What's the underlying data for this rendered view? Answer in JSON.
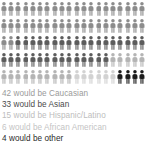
{
  "infographic": {
    "type": "pictogram",
    "total_figures": 100,
    "rows": 5,
    "columns": 20,
    "icon_name": "person-icon"
  },
  "chart_data": {
    "type": "bar",
    "title": "",
    "subtitle": "",
    "xlabel": "",
    "ylabel": "",
    "categories": [
      "Caucasian",
      "Asian",
      "Hispanic/Latino",
      "African American",
      "Other"
    ],
    "values": [
      42,
      33,
      15,
      6,
      4
    ],
    "unit": "people per 100",
    "total": 100,
    "grid": false,
    "legend_position": "below",
    "colors": [
      "#8c8c8c",
      "#5c5c5c",
      "#b4b4b4",
      "#d2d2d2",
      "#1c1c1c"
    ],
    "legend_entries": [
      "42 would be Caucasian",
      "33 would be Asian",
      "15 would be Hispanic/Latino",
      "6 would be African American",
      "4 would be other"
    ]
  },
  "legend": {
    "items": [
      {
        "count": "42",
        "label": "42 would be Caucasian",
        "group": "Caucasian",
        "color": "#8c8c8c",
        "text_color": "#9a9a9a"
      },
      {
        "count": "33",
        "label": "33 would be Asian",
        "group": "Asian",
        "color": "#5c5c5c",
        "text_color": "#4a4a4a"
      },
      {
        "count": "15",
        "label": "15 would be Hispanic/Latino",
        "group": "Hispanic/Latino",
        "color": "#b4b4b4",
        "text_color": "#bdbdbd"
      },
      {
        "count": "6",
        "label": "6 would be African American",
        "group": "African American",
        "color": "#d2d2d2",
        "text_color": "#c4c4c4"
      },
      {
        "count": "4",
        "label": "4 would be other",
        "group": "Other",
        "color": "#1c1c1c",
        "text_color": "#2b2b2b"
      }
    ]
  },
  "figure_sequence": [
    "#8c8c8c",
    "#8c8c8c",
    "#8c8c8c",
    "#8c8c8c",
    "#8c8c8c",
    "#8c8c8c",
    "#8c8c8c",
    "#8c8c8c",
    "#8c8c8c",
    "#8c8c8c",
    "#8c8c8c",
    "#8c8c8c",
    "#8c8c8c",
    "#8c8c8c",
    "#8c8c8c",
    "#8c8c8c",
    "#8c8c8c",
    "#8c8c8c",
    "#8c8c8c",
    "#8c8c8c",
    "#8c8c8c",
    "#8c8c8c",
    "#8c8c8c",
    "#8c8c8c",
    "#8c8c8c",
    "#8c8c8c",
    "#8c8c8c",
    "#8c8c8c",
    "#8c8c8c",
    "#8c8c8c",
    "#8c8c8c",
    "#8c8c8c",
    "#8c8c8c",
    "#8c8c8c",
    "#8c8c8c",
    "#8c8c8c",
    "#8c8c8c",
    "#8c8c8c",
    "#8c8c8c",
    "#8c8c8c",
    "#8c8c8c",
    "#8c8c8c",
    "#5c5c5c",
    "#5c5c5c",
    "#5c5c5c",
    "#5c5c5c",
    "#5c5c5c",
    "#5c5c5c",
    "#5c5c5c",
    "#5c5c5c",
    "#5c5c5c",
    "#5c5c5c",
    "#5c5c5c",
    "#5c5c5c",
    "#5c5c5c",
    "#5c5c5c",
    "#5c5c5c",
    "#5c5c5c",
    "#5c5c5c",
    "#5c5c5c",
    "#5c5c5c",
    "#5c5c5c",
    "#5c5c5c",
    "#5c5c5c",
    "#5c5c5c",
    "#5c5c5c",
    "#5c5c5c",
    "#5c5c5c",
    "#5c5c5c",
    "#5c5c5c",
    "#5c5c5c",
    "#5c5c5c",
    "#5c5c5c",
    "#5c5c5c",
    "#5c5c5c",
    "#b4b4b4",
    "#b4b4b4",
    "#b4b4b4",
    "#b4b4b4",
    "#b4b4b4",
    "#b4b4b4",
    "#b4b4b4",
    "#b4b4b4",
    "#b4b4b4",
    "#b4b4b4",
    "#b4b4b4",
    "#b4b4b4",
    "#b4b4b4",
    "#b4b4b4",
    "#b4b4b4",
    "#d2d2d2",
    "#d2d2d2",
    "#d2d2d2",
    "#d2d2d2",
    "#d2d2d2",
    "#d2d2d2",
    "#1c1c1c",
    "#1c1c1c",
    "#1c1c1c",
    "#1c1c1c"
  ]
}
